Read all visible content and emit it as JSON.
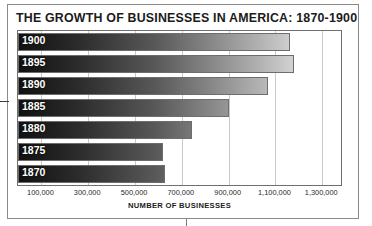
{
  "chart_data": {
    "type": "bar",
    "orientation": "horizontal",
    "title": "THE GROWTH OF BUSINESSES IN AMERICA: 1870-1900",
    "xlabel": "NUMBER OF BUSINESSES",
    "ylabel": "",
    "categories": [
      "1900",
      "1895",
      "1890",
      "1885",
      "1880",
      "1875",
      "1870"
    ],
    "values": [
      1160000,
      1180000,
      1070000,
      900000,
      745000,
      620000,
      630000
    ],
    "xlim": [
      0,
      1380000
    ],
    "xticks": [
      100000,
      300000,
      500000,
      700000,
      900000,
      1100000,
      1300000
    ],
    "xtick_labels": [
      "100,000",
      "300,000",
      "500,000",
      "700,000",
      "900,000",
      "1,100,000",
      "1,300,000"
    ],
    "grid": true,
    "legend": false,
    "bar_style": "horizontal dark-to-light gradient with thin gray outline"
  },
  "axis_colors": {
    "gridline": "#c9c9c9",
    "border": "#6f6f6f",
    "text": "#1b1b1b",
    "bar_dark": "#111111",
    "bar_light": "#f6f6f6"
  }
}
